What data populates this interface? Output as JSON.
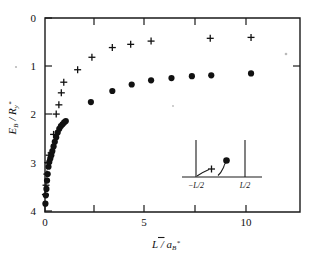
{
  "figure": {
    "background_color": "#ffffff",
    "ink_color": "#111111"
  },
  "chart_data": {
    "type": "scatter",
    "title": "",
    "subtitle": "",
    "xlabel": "L / a̅B*",
    "xlabel_parts": {
      "numerator": "L",
      "denominator": "a",
      "denominator_sub": "B",
      "denominator_sup": "*"
    },
    "ylabel": "EB / Ry*",
    "ylabel_parts": {
      "numerator": "E",
      "numerator_sub": "B",
      "denominator": "R",
      "denominator_sub": "y",
      "denominator_sup": "*"
    },
    "xlim": [
      0,
      12.5
    ],
    "ylim": [
      4.2,
      0
    ],
    "y_axis_inverted": true,
    "grid": false,
    "legend": "none",
    "x_major_ticks": [
      0,
      5,
      10
    ],
    "x_minor_ticks": [
      2.5,
      7.5
    ],
    "x_tick_labels": [
      "0",
      "5",
      "10"
    ],
    "y_major_ticks": [
      0,
      1,
      2,
      3,
      4
    ],
    "y_tick_labels": [
      "0",
      "1",
      "2",
      "3",
      "4"
    ],
    "series": [
      {
        "name": "plus-series",
        "marker": "plus",
        "points": [
          [
            0.02,
            3.82
          ],
          [
            0.05,
            3.62
          ],
          [
            0.09,
            3.38
          ],
          [
            0.14,
            3.13
          ],
          [
            0.2,
            2.97
          ],
          [
            0.3,
            2.92
          ],
          [
            0.42,
            2.52
          ],
          [
            0.55,
            2.08
          ],
          [
            0.68,
            1.88
          ],
          [
            0.8,
            1.62
          ],
          [
            0.92,
            1.39
          ],
          [
            1.6,
            1.12
          ],
          [
            2.3,
            0.85
          ],
          [
            3.3,
            0.64
          ],
          [
            4.2,
            0.57
          ],
          [
            5.2,
            0.5
          ],
          [
            8.1,
            0.44
          ],
          [
            10.1,
            0.42
          ]
        ]
      },
      {
        "name": "dot-series",
        "marker": "circle",
        "points": [
          [
            0.02,
            4.02
          ],
          [
            0.04,
            3.84
          ],
          [
            0.07,
            3.7
          ],
          [
            0.1,
            3.52
          ],
          [
            0.13,
            3.38
          ],
          [
            0.17,
            3.22
          ],
          [
            0.21,
            3.12
          ],
          [
            0.26,
            3.04
          ],
          [
            0.31,
            2.97
          ],
          [
            0.36,
            2.88
          ],
          [
            0.42,
            2.78
          ],
          [
            0.48,
            2.68
          ],
          [
            0.55,
            2.58
          ],
          [
            0.62,
            2.48
          ],
          [
            0.7,
            2.4
          ],
          [
            0.78,
            2.34
          ],
          [
            0.86,
            2.3
          ],
          [
            0.94,
            2.26
          ],
          [
            1.02,
            2.23
          ],
          [
            2.25,
            1.82
          ],
          [
            3.3,
            1.58
          ],
          [
            4.25,
            1.44
          ],
          [
            5.2,
            1.35
          ],
          [
            6.2,
            1.3
          ],
          [
            7.2,
            1.26
          ],
          [
            8.15,
            1.24
          ],
          [
            10.1,
            1.2
          ]
        ]
      }
    ]
  },
  "inset": {
    "name": "quantum-well-schematic",
    "left_wall_label": "−L/2",
    "right_wall_label": "L/2",
    "charge_label": "+",
    "particle_marker": "filled-dot"
  }
}
